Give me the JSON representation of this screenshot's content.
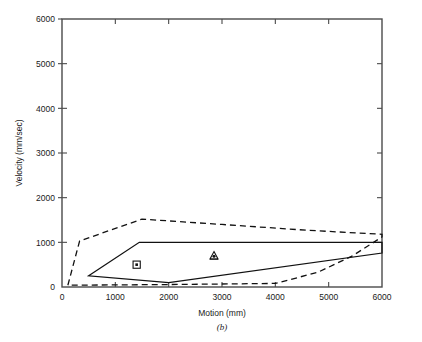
{
  "figure": {
    "caption": "(b)"
  },
  "chart_data": {
    "type": "line",
    "title": "",
    "xlabel": "Motion (mm)",
    "ylabel": "Velocity (mm/sec)",
    "xlim": [
      0,
      6000
    ],
    "ylim": [
      0,
      6000
    ],
    "xticks": [
      0,
      1000,
      2000,
      3000,
      4000,
      5000,
      6000
    ],
    "yticks": [
      0,
      1000,
      2000,
      3000,
      4000,
      5000,
      6000
    ],
    "xticklabels": [
      "0",
      "1000",
      "2000",
      "3000",
      "4000",
      "5000",
      "6000"
    ],
    "yticklabels": [
      "0",
      "1000",
      "2000",
      "3000",
      "4000",
      "5000",
      "6000"
    ],
    "grid": false,
    "legend": "none",
    "series": [
      {
        "name": "inner-envelope",
        "style": "solid",
        "closed": true,
        "points": [
          [
            500,
            250
          ],
          [
            1450,
            1000
          ],
          [
            6000,
            1000
          ],
          [
            6000,
            760
          ],
          [
            2000,
            100
          ],
          [
            500,
            250
          ]
        ]
      },
      {
        "name": "outer-envelope",
        "style": "dashed",
        "closed": true,
        "points": [
          [
            110,
            40
          ],
          [
            330,
            1030
          ],
          [
            1500,
            1520
          ],
          [
            3000,
            1400
          ],
          [
            4600,
            1270
          ],
          [
            6000,
            1180
          ],
          [
            6000,
            1120
          ],
          [
            5450,
            700
          ],
          [
            4800,
            330
          ],
          [
            4000,
            80
          ],
          [
            2000,
            55
          ],
          [
            110,
            40
          ]
        ]
      }
    ],
    "markers": [
      {
        "name": "square-dot-marker",
        "symbol": "squared-dot",
        "x": 1400,
        "y": 500
      },
      {
        "name": "triangle-marker",
        "symbol": "triangle",
        "x": 2850,
        "y": 700
      }
    ],
    "colors": {
      "line": "#111111",
      "axis": "#4a4a4a",
      "background": "#ffffff"
    }
  }
}
